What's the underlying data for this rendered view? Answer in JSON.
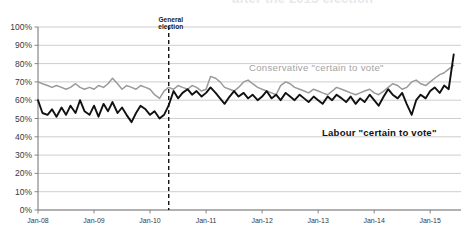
{
  "figure": {
    "cropped_title_fragment": "after the 2015 election",
    "background_color": "#ffffff"
  },
  "annotations": {
    "election_marker": {
      "line1": "General",
      "line2": "election",
      "x_value": "2010-05"
    },
    "series_labels": {
      "conservative": "Conservative \"certain to vote\"",
      "labour": "Labour \"certain to vote\""
    }
  },
  "colors": {
    "conservative_line": "#9a9a9a",
    "labour_line": "#111111",
    "gridline": "#b9b9b9",
    "axis": "#7d7d7d",
    "event_line": "#111111"
  },
  "chart_data": {
    "type": "line",
    "title": "",
    "xlabel": "",
    "ylabel": "",
    "ylim": [
      0,
      100
    ],
    "ytick_labels": [
      "100%",
      "90%",
      "80%",
      "70%",
      "60%",
      "50%",
      "40%",
      "30%",
      "20%",
      "10%",
      "0%"
    ],
    "ytick_values": [
      100,
      90,
      80,
      70,
      60,
      50,
      40,
      30,
      20,
      10,
      0
    ],
    "xtick_labels": [
      "Jan-08",
      "Jan-09",
      "Jan-10",
      "Jan-11",
      "Jan-12",
      "Jan-13",
      "Jan-14",
      "Jan-15"
    ],
    "xtick_values": [
      2008.0,
      2009.0,
      2010.0,
      2011.0,
      2012.0,
      2013.0,
      2014.0,
      2015.0
    ],
    "xlim": [
      2008.0,
      2015.55
    ],
    "grid": true,
    "legend_position": "inline-annotations",
    "series": [
      {
        "name": "Conservative \"certain to vote\"",
        "color": "#9a9a9a",
        "x": [
          2008.0,
          2008.08,
          2008.17,
          2008.25,
          2008.33,
          2008.42,
          2008.5,
          2008.58,
          2008.67,
          2008.75,
          2008.83,
          2008.92,
          2009.0,
          2009.08,
          2009.17,
          2009.25,
          2009.33,
          2009.42,
          2009.5,
          2009.58,
          2009.67,
          2009.75,
          2009.83,
          2009.92,
          2010.0,
          2010.08,
          2010.17,
          2010.25,
          2010.33,
          2010.42,
          2010.5,
          2010.58,
          2010.67,
          2010.75,
          2010.83,
          2010.92,
          2011.0,
          2011.08,
          2011.17,
          2011.25,
          2011.33,
          2011.42,
          2011.5,
          2011.58,
          2011.67,
          2011.75,
          2011.83,
          2011.92,
          2012.0,
          2012.08,
          2012.17,
          2012.25,
          2012.33,
          2012.42,
          2012.5,
          2012.58,
          2012.67,
          2012.75,
          2012.83,
          2012.92,
          2013.0,
          2013.08,
          2013.17,
          2013.25,
          2013.33,
          2013.42,
          2013.5,
          2013.58,
          2013.67,
          2013.75,
          2013.83,
          2013.92,
          2014.0,
          2014.08,
          2014.17,
          2014.25,
          2014.33,
          2014.42,
          2014.5,
          2014.58,
          2014.67,
          2014.75,
          2014.83,
          2014.92,
          2015.0,
          2015.08,
          2015.17,
          2015.25,
          2015.33,
          2015.42
        ],
        "values": [
          70,
          69,
          68,
          67,
          68,
          67,
          66,
          67,
          69,
          67,
          66,
          67,
          66,
          68,
          67,
          69,
          72,
          69,
          66,
          68,
          67,
          66,
          68,
          67,
          66,
          63,
          61,
          65,
          67,
          66,
          68,
          67,
          66,
          68,
          67,
          65,
          66,
          73,
          72,
          70,
          67,
          66,
          65,
          67,
          70,
          71,
          69,
          67,
          66,
          65,
          64,
          63,
          68,
          70,
          69,
          67,
          66,
          65,
          64,
          66,
          65,
          64,
          63,
          65,
          67,
          66,
          65,
          64,
          63,
          64,
          65,
          66,
          64,
          63,
          65,
          67,
          69,
          68,
          66,
          67,
          70,
          71,
          69,
          68,
          70,
          72,
          74,
          75,
          77,
          79
        ]
      },
      {
        "name": "Labour \"certain to vote\"",
        "color": "#111111",
        "x": [
          2008.0,
          2008.08,
          2008.17,
          2008.25,
          2008.33,
          2008.42,
          2008.5,
          2008.58,
          2008.67,
          2008.75,
          2008.83,
          2008.92,
          2009.0,
          2009.08,
          2009.17,
          2009.25,
          2009.33,
          2009.42,
          2009.5,
          2009.58,
          2009.67,
          2009.75,
          2009.83,
          2009.92,
          2010.0,
          2010.08,
          2010.17,
          2010.25,
          2010.33,
          2010.42,
          2010.5,
          2010.58,
          2010.67,
          2010.75,
          2010.83,
          2010.92,
          2011.0,
          2011.08,
          2011.17,
          2011.25,
          2011.33,
          2011.42,
          2011.5,
          2011.58,
          2011.67,
          2011.75,
          2011.83,
          2011.92,
          2012.0,
          2012.08,
          2012.17,
          2012.25,
          2012.33,
          2012.42,
          2012.5,
          2012.58,
          2012.67,
          2012.75,
          2012.83,
          2012.92,
          2013.0,
          2013.08,
          2013.17,
          2013.25,
          2013.33,
          2013.42,
          2013.5,
          2013.58,
          2013.67,
          2013.75,
          2013.83,
          2013.92,
          2014.0,
          2014.08,
          2014.17,
          2014.25,
          2014.33,
          2014.42,
          2014.5,
          2014.58,
          2014.67,
          2014.75,
          2014.83,
          2014.92,
          2015.0,
          2015.08,
          2015.17,
          2015.25,
          2015.33,
          2015.42
        ],
        "values": [
          60,
          53,
          52,
          55,
          51,
          56,
          52,
          57,
          53,
          60,
          54,
          52,
          57,
          51,
          58,
          54,
          59,
          53,
          56,
          52,
          48,
          53,
          57,
          55,
          52,
          54,
          50,
          52,
          57,
          65,
          61,
          64,
          66,
          63,
          65,
          62,
          64,
          67,
          64,
          61,
          58,
          62,
          65,
          62,
          64,
          61,
          63,
          60,
          62,
          65,
          61,
          63,
          60,
          64,
          62,
          60,
          63,
          61,
          59,
          62,
          60,
          58,
          62,
          60,
          63,
          61,
          59,
          62,
          58,
          61,
          59,
          63,
          60,
          57,
          62,
          66,
          63,
          61,
          64,
          58,
          52,
          60,
          63,
          61,
          65,
          67,
          64,
          68,
          66,
          85
        ]
      }
    ]
  }
}
